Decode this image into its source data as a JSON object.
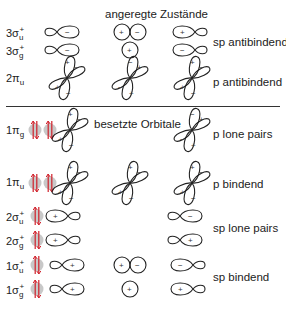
{
  "diagram": {
    "type": "molecular-orbital-diagram",
    "sections": {
      "excited": {
        "title": "angeregte Zustände"
      },
      "occupied": {
        "title": "besetzte Orbitale"
      }
    },
    "orbitals": [
      {
        "symbol": "σ",
        "index": "3",
        "sub": "u",
        "sup": "+",
        "group_label": "sp antibindend",
        "electrons": 0
      },
      {
        "symbol": "σ",
        "index": "3",
        "sub": "g",
        "sup": "+",
        "group_label": "",
        "electrons": 0
      },
      {
        "symbol": "π",
        "index": "2",
        "sub": "u",
        "sup": "",
        "group_label": "p antibindend",
        "electrons": 0
      },
      {
        "symbol": "π",
        "index": "1",
        "sub": "g",
        "sup": "",
        "group_label": "p lone pairs",
        "electrons": 4
      },
      {
        "symbol": "π",
        "index": "1",
        "sub": "u",
        "sup": "",
        "group_label": "p bindend",
        "electrons": 4
      },
      {
        "symbol": "σ",
        "index": "2",
        "sub": "u",
        "sup": "+",
        "group_label": "sp lone pairs",
        "electrons": 2
      },
      {
        "symbol": "σ",
        "index": "2",
        "sub": "g",
        "sup": "+",
        "group_label": "",
        "electrons": 2
      },
      {
        "symbol": "σ",
        "index": "1",
        "sub": "u",
        "sup": "+",
        "group_label": "sp bindend",
        "electrons": 2
      },
      {
        "symbol": "σ",
        "index": "1",
        "sub": "g",
        "sup": "+",
        "group_label": "",
        "electrons": 2
      }
    ],
    "labels": {
      "r0": {
        "idx": "3σ",
        "sub": "u",
        "sup": "+"
      },
      "r1": {
        "idx": "3σ",
        "sub": "g",
        "sup": "+"
      },
      "r2": {
        "idx": "2π",
        "sub": "u"
      },
      "r3": {
        "idx": "1π",
        "sub": "g"
      },
      "r4": {
        "idx": "1π",
        "sub": "u"
      },
      "r5": {
        "idx": "2σ",
        "sub": "u",
        "sup": "+"
      },
      "r6": {
        "idx": "2σ",
        "sub": "g",
        "sup": "+"
      },
      "r7": {
        "idx": "1σ",
        "sub": "u",
        "sup": "+"
      },
      "r8": {
        "idx": "1σ",
        "sub": "g",
        "sup": "+"
      }
    },
    "group_labels": {
      "sp_antibonding": "sp antibindend",
      "p_antibonding": "p antibindend",
      "p_lone_pairs": "p lone pairs",
      "p_bonding": "p bindend",
      "sp_lone_pairs": "sp lone pairs",
      "sp_bonding": "sp bindend"
    },
    "signs": {
      "plus": "+",
      "minus": "−"
    },
    "colors": {
      "electron_arrow": "#d0202a",
      "electron_box": "#c8c8c8",
      "line": "#222222"
    }
  }
}
